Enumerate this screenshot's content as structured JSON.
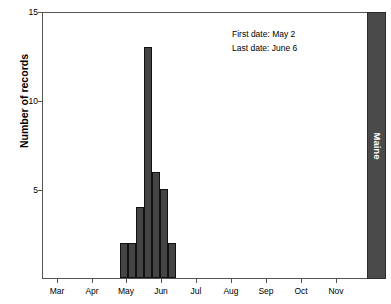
{
  "chart_data": {
    "type": "bar",
    "title": "",
    "subtitle": "",
    "xlabel": "",
    "ylabel": "Number of records",
    "ylim": [
      0,
      15
    ],
    "yticks": [
      5,
      10,
      15
    ],
    "ytick_labels": [
      "5",
      "10",
      "15"
    ],
    "xtick_labels": [
      "Mar",
      "Apr",
      "May",
      "Jun",
      "Jul",
      "Aug",
      "Sep",
      "Oct",
      "Nov"
    ],
    "grid": false,
    "legend": "none",
    "panel_label": "Maine",
    "bar_color": "#454545",
    "bar_edge_color": "#111111",
    "categories": [
      "May wk1",
      "May wk2",
      "May wk3",
      "May wk4",
      "Jun wk1",
      "Jun wk2",
      "Jun wk3"
    ],
    "values": [
      2,
      2,
      4,
      13,
      6,
      5,
      2
    ],
    "bars": [
      {
        "label": "May wk1",
        "value": 2,
        "x_px": 120.0,
        "w_px": 8.0
      },
      {
        "label": "May wk2",
        "value": 2,
        "x_px": 128.0,
        "w_px": 8.0
      },
      {
        "label": "May wk3",
        "value": 4,
        "x_px": 136.0,
        "w_px": 8.0
      },
      {
        "label": "May wk4",
        "value": 13,
        "x_px": 144.0,
        "w_px": 8.0
      },
      {
        "label": "Jun wk1",
        "value": 6,
        "x_px": 152.0,
        "w_px": 8.0
      },
      {
        "label": "Jun wk2",
        "value": 5,
        "x_px": 160.0,
        "w_px": 8.0
      },
      {
        "label": "Jun wk3",
        "value": 2,
        "x_px": 168.0,
        "w_px": 8.0
      }
    ],
    "annotations": [
      {
        "name": "first-date",
        "text": "First date: May 2"
      },
      {
        "name": "last-date",
        "text": "Last date: June 6"
      }
    ]
  },
  "axes": {
    "y_title": "Number of records",
    "y_ticks": [
      {
        "label": "15",
        "y_px": 12
      },
      {
        "label": "10",
        "y_px": 101
      },
      {
        "label": "5",
        "y_px": 190
      }
    ],
    "x_ticks": [
      {
        "label": "Mar",
        "x_px": 57
      },
      {
        "label": "Apr",
        "x_px": 92
      },
      {
        "label": "May",
        "x_px": 126
      },
      {
        "label": "Jun",
        "x_px": 161
      },
      {
        "label": "Jul",
        "x_px": 196
      },
      {
        "label": "Aug",
        "x_px": 231
      },
      {
        "label": "Sep",
        "x_px": 266
      },
      {
        "label": "Oct",
        "x_px": 301
      },
      {
        "label": "Nov",
        "x_px": 336
      }
    ]
  },
  "panel": {
    "label": "Maine",
    "color": "#4a4a4a",
    "text_color": "#ffffff"
  }
}
